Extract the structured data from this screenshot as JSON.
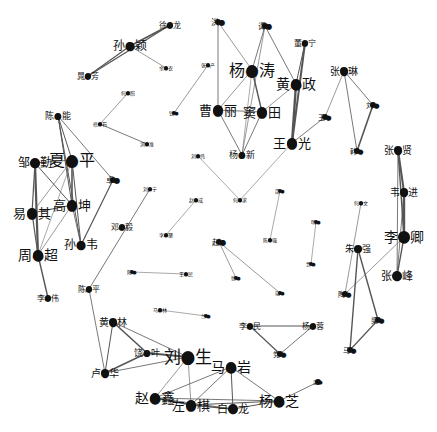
{
  "graph": {
    "title": "",
    "background": "#ffffff",
    "node_color": "#111111",
    "edge_color": "#555555",
    "nodes": [
      {
        "id": "sunyingying",
        "label": "孙●颖",
        "x": 130,
        "y": 46,
        "r": 4,
        "size": 12
      },
      {
        "id": "xulong",
        "label": "徐●龙",
        "x": 170,
        "y": 25,
        "r": 3,
        "size": 8
      },
      {
        "id": "jingfang",
        "label": "晁●芳",
        "x": 88,
        "y": 76,
        "r": 3,
        "size": 8
      },
      {
        "id": "yuanwei",
        "label": "余●衣",
        "x": 166,
        "y": 68,
        "r": 2,
        "size": 5
      },
      {
        "id": "hezhao",
        "label": "何●照",
        "x": 128,
        "y": 93,
        "r": 2,
        "size": 5
      },
      {
        "id": "zhangtai",
        "label": "修●石",
        "x": 100,
        "y": 124,
        "r": 2,
        "size": 5
      },
      {
        "id": "shengsheng",
        "label": "浏●准",
        "x": 147,
        "y": 144,
        "r": 2,
        "size": 5
      },
      {
        "id": "zhangchan",
        "label": "张●产",
        "x": 208,
        "y": 65,
        "r": 2,
        "size": 5
      },
      {
        "id": "jinmin",
        "label": "钱●",
        "x": 174,
        "y": 113,
        "r": 2,
        "size": 5
      },
      {
        "id": "hongbei",
        "label": "洪●",
        "x": 218,
        "y": 22,
        "r": 3,
        "size": 8
      },
      {
        "id": "tongyuan",
        "label": "谭●",
        "x": 265,
        "y": 26,
        "r": 3,
        "size": 8
      },
      {
        "id": "yangjiatao",
        "label": "杨●涛",
        "x": 252,
        "y": 70,
        "r": 5,
        "size": 16
      },
      {
        "id": "dongning",
        "label": "董●宁",
        "x": 305,
        "y": 43,
        "r": 3,
        "size": 8
      },
      {
        "id": "huangzheng",
        "label": "黄●政",
        "x": 296,
        "y": 84,
        "r": 5,
        "size": 14
      },
      {
        "id": "caoli",
        "label": "曹●丽",
        "x": 218,
        "y": 110,
        "r": 5,
        "size": 13
      },
      {
        "id": "dutian",
        "label": "窦●田",
        "x": 262,
        "y": 112,
        "r": 5,
        "size": 13
      },
      {
        "id": "yangxin",
        "label": "杨●新",
        "x": 242,
        "y": 155,
        "r": 3,
        "size": 9
      },
      {
        "id": "wangguang",
        "label": "王●光",
        "x": 292,
        "y": 143,
        "r": 5,
        "size": 13
      },
      {
        "id": "zhanglin",
        "label": "张●琳",
        "x": 344,
        "y": 71,
        "r": 4,
        "size": 10
      },
      {
        "id": "liuhao",
        "label": "刘●",
        "x": 373,
        "y": 105,
        "r": 3,
        "size": 7
      },
      {
        "id": "wangyu",
        "label": "王●",
        "x": 325,
        "y": 117,
        "r": 3,
        "size": 7
      },
      {
        "id": "hanhua",
        "label": "韩●",
        "x": 357,
        "y": 151,
        "r": 3,
        "size": 7
      },
      {
        "id": "zhangxian",
        "label": "张●贤",
        "x": 398,
        "y": 150,
        "r": 4,
        "size": 10
      },
      {
        "id": "weijin",
        "label": "韦●进",
        "x": 404,
        "y": 192,
        "r": 4,
        "size": 10
      },
      {
        "id": "liqing",
        "label": "李●卿",
        "x": 404,
        "y": 237,
        "r": 6,
        "size": 14
      },
      {
        "id": "zhangfeng",
        "label": "张●峰",
        "x": 397,
        "y": 276,
        "r": 5,
        "size": 11
      },
      {
        "id": "hewen",
        "label": "何●文",
        "x": 361,
        "y": 203,
        "r": 2,
        "size": 5
      },
      {
        "id": "zhuqiang",
        "label": "朱●强",
        "x": 358,
        "y": 249,
        "r": 4,
        "size": 9
      },
      {
        "id": "tengjie",
        "label": "陶●",
        "x": 345,
        "y": 294,
        "r": 3,
        "size": 7
      },
      {
        "id": "liangjie",
        "label": "梁●",
        "x": 378,
        "y": 320,
        "r": 3,
        "size": 7
      },
      {
        "id": "mahong",
        "label": "马●",
        "x": 350,
        "y": 350,
        "r": 3,
        "size": 7
      },
      {
        "id": "chenneng",
        "label": "陈●能",
        "x": 58,
        "y": 116,
        "r": 3,
        "size": 9
      },
      {
        "id": "zoumin",
        "label": "邹●勤",
        "x": 35,
        "y": 163,
        "r": 5,
        "size": 12
      },
      {
        "id": "xiaping",
        "label": "夏●平",
        "x": 72,
        "y": 160,
        "r": 5,
        "size": 16
      },
      {
        "id": "yiqi",
        "label": "易●其",
        "x": 32,
        "y": 213,
        "r": 5,
        "size": 13
      },
      {
        "id": "gaoshen",
        "label": "高●坤",
        "x": 72,
        "y": 205,
        "r": 5,
        "size": 13
      },
      {
        "id": "sunwei",
        "label": "孙●韦",
        "x": 81,
        "y": 245,
        "r": 4,
        "size": 12
      },
      {
        "id": "zhouchao",
        "label": "周●超",
        "x": 38,
        "y": 255,
        "r": 5,
        "size": 14
      },
      {
        "id": "liwei",
        "label": "李●伟",
        "x": 48,
        "y": 298,
        "r": 3,
        "size": 8
      },
      {
        "id": "yingjun",
        "label": "卓●",
        "x": 113,
        "y": 180,
        "r": 3,
        "size": 8
      },
      {
        "id": "dengyi",
        "label": "邓●毅",
        "x": 122,
        "y": 227,
        "r": 3,
        "size": 8
      },
      {
        "id": "liuning",
        "label": "刘●宁",
        "x": 150,
        "y": 189,
        "r": 2,
        "size": 5
      },
      {
        "id": "chenping",
        "label": "陈●平",
        "x": 89,
        "y": 289,
        "r": 3,
        "size": 8
      },
      {
        "id": "shengfeng",
        "label": "刘●伟",
        "x": 198,
        "y": 156,
        "r": 2,
        "size": 5
      },
      {
        "id": "zhaocheng",
        "label": "赵●成",
        "x": 196,
        "y": 200,
        "r": 2,
        "size": 5
      },
      {
        "id": "liju",
        "label": "李●聚",
        "x": 166,
        "y": 235,
        "r": 2,
        "size": 5
      },
      {
        "id": "heyan",
        "label": "何●求",
        "x": 240,
        "y": 200,
        "r": 2,
        "size": 5
      },
      {
        "id": "shaoping",
        "label": "邵●",
        "x": 280,
        "y": 191,
        "r": 2,
        "size": 5
      },
      {
        "id": "chenmei",
        "label": "陈●强",
        "x": 270,
        "y": 240,
        "r": 2,
        "size": 5
      },
      {
        "id": "zhaozhuang",
        "label": "赵●",
        "x": 219,
        "y": 242,
        "r": 3,
        "size": 8
      },
      {
        "id": "xuzhi",
        "label": "徐●",
        "x": 236,
        "y": 278,
        "r": 2,
        "size": 5
      },
      {
        "id": "ruiyan",
        "label": "瑞●",
        "x": 280,
        "y": 293,
        "r": 2,
        "size": 5
      },
      {
        "id": "mingxuan",
        "label": "明●",
        "x": 316,
        "y": 222,
        "r": 2,
        "size": 5
      },
      {
        "id": "jiaqin",
        "label": "贾●",
        "x": 311,
        "y": 264,
        "r": 2,
        "size": 5
      },
      {
        "id": "zhaolin",
        "label": "陈●",
        "x": 132,
        "y": 272,
        "r": 2,
        "size": 5
      },
      {
        "id": "wangli",
        "label": "王●民",
        "x": 186,
        "y": 274,
        "r": 2,
        "size": 5
      },
      {
        "id": "mazhen",
        "label": "马●林",
        "x": 160,
        "y": 310,
        "r": 2,
        "size": 5
      },
      {
        "id": "lanlan",
        "label": "兰●",
        "x": 206,
        "y": 316,
        "r": 2,
        "size": 5
      },
      {
        "id": "limin",
        "label": "李●民",
        "x": 250,
        "y": 326,
        "r": 3,
        "size": 8
      },
      {
        "id": "yangrong",
        "label": "杨●蓉",
        "x": 313,
        "y": 326,
        "r": 3,
        "size": 8
      },
      {
        "id": "xuepeng",
        "label": "党●",
        "x": 280,
        "y": 354,
        "r": 3,
        "size": 7
      },
      {
        "id": "huanglin",
        "label": "黄●林",
        "x": 113,
        "y": 322,
        "r": 4,
        "size": 10
      },
      {
        "id": "jiaye",
        "label": "饶●叶",
        "x": 147,
        "y": 353,
        "r": 3,
        "size": 9
      },
      {
        "id": "luhua",
        "label": "卢●华",
        "x": 105,
        "y": 373,
        "r": 4,
        "size": 10
      },
      {
        "id": "liuxusheng",
        "label": "刘●生",
        "x": 188,
        "y": 357,
        "r": 6,
        "size": 17
      },
      {
        "id": "mayan",
        "label": "马●岩",
        "x": 231,
        "y": 367,
        "r": 5,
        "size": 14
      },
      {
        "id": "zhaoxin",
        "label": "赵●鑫",
        "x": 155,
        "y": 398,
        "r": 5,
        "size": 14
      },
      {
        "id": "zuobing",
        "label": "左●棋",
        "x": 191,
        "y": 405,
        "r": 5,
        "size": 13
      },
      {
        "id": "bailong",
        "label": "白●龙",
        "x": 233,
        "y": 409,
        "r": 5,
        "size": 11
      },
      {
        "id": "yangzhi",
        "label": "杨●芝",
        "x": 279,
        "y": 401,
        "r": 5,
        "size": 14
      },
      {
        "id": "youxuan",
        "label": "游●",
        "x": 318,
        "y": 382,
        "r": 3,
        "size": 5
      }
    ],
    "edges": [
      {
        "s": "sunyingying",
        "t": "xulong",
        "w": 1.6
      },
      {
        "s": "xulong",
        "t": "jingfang",
        "w": 1.2
      },
      {
        "s": "sunyingying",
        "t": "jingfang",
        "w": 1.2
      },
      {
        "s": "sunyingying",
        "t": "yuanwei",
        "w": 0.6
      },
      {
        "s": "hezhao",
        "t": "zhangtai",
        "w": 0.6
      },
      {
        "s": "zhangtai",
        "t": "shengsheng",
        "w": 0.8
      },
      {
        "s": "zhangchan",
        "t": "jinmin",
        "w": 0.6
      },
      {
        "s": "hongbei",
        "t": "caoli",
        "w": 0.8
      },
      {
        "s": "hongbei",
        "t": "yangjiatao",
        "w": 0.6
      },
      {
        "s": "tongyuan",
        "t": "yangjiatao",
        "w": 0.8
      },
      {
        "s": "tongyuan",
        "t": "huangzheng",
        "w": 0.8
      },
      {
        "s": "tongyuan",
        "t": "yangxin",
        "w": 0.6
      },
      {
        "s": "yangjiatao",
        "t": "caoli",
        "w": 0.6
      },
      {
        "s": "yangjiatao",
        "t": "dutian",
        "w": 1.4
      },
      {
        "s": "yangjiatao",
        "t": "yangxin",
        "w": 0.5
      },
      {
        "s": "caoli",
        "t": "dutian",
        "w": 0.8
      },
      {
        "s": "caoli",
        "t": "yangxin",
        "w": 0.8
      },
      {
        "s": "dutian",
        "t": "yangxin",
        "w": 0.8
      },
      {
        "s": "dutian",
        "t": "huangzheng",
        "w": 0.6
      },
      {
        "s": "huangzheng",
        "t": "wangguang",
        "w": 2.4
      },
      {
        "s": "dongning",
        "t": "wangguang",
        "w": 2.0
      },
      {
        "s": "dongning",
        "t": "huangzheng",
        "w": 1.0
      },
      {
        "s": "wangguang",
        "t": "wangyu",
        "w": 0.8
      },
      {
        "s": "wangguang",
        "t": "heyan",
        "w": 0.5
      },
      {
        "s": "zhanglin",
        "t": "liuhao",
        "w": 0.8
      },
      {
        "s": "zhanglin",
        "t": "wangyu",
        "w": 0.6
      },
      {
        "s": "zhanglin",
        "t": "hanhua",
        "w": 0.8
      },
      {
        "s": "liuhao",
        "t": "hanhua",
        "w": 1.6
      },
      {
        "s": "zhangxian",
        "t": "weijin",
        "w": 2.0
      },
      {
        "s": "zhangxian",
        "t": "liqing",
        "w": 1.4
      },
      {
        "s": "zhangxian",
        "t": "zhangfeng",
        "w": 0.8
      },
      {
        "s": "weijin",
        "t": "liqing",
        "w": 2.4
      },
      {
        "s": "weijin",
        "t": "zhangfeng",
        "w": 0.8
      },
      {
        "s": "liqing",
        "t": "zhangfeng",
        "w": 1.4
      },
      {
        "s": "liqing",
        "t": "tengjie",
        "w": 0.6
      },
      {
        "s": "hewen",
        "t": "tengjie",
        "w": 0.6
      },
      {
        "s": "zhuqiang",
        "t": "mahong",
        "w": 1.4
      },
      {
        "s": "zhuqiang",
        "t": "liangjie",
        "w": 1.4
      },
      {
        "s": "liangjie",
        "t": "mahong",
        "w": 1.2
      },
      {
        "s": "chenneng",
        "t": "xiaping",
        "w": 1.0
      },
      {
        "s": "chenneng",
        "t": "gaoshen",
        "w": 1.0
      },
      {
        "s": "chenneng",
        "t": "sunwei",
        "w": 1.0
      },
      {
        "s": "chenneng",
        "t": "yingjun",
        "w": 0.8
      },
      {
        "s": "zoumin",
        "t": "xiaping",
        "w": 0.8
      },
      {
        "s": "zoumin",
        "t": "gaoshen",
        "w": 1.0
      },
      {
        "s": "zoumin",
        "t": "zhouchao",
        "w": 2.2
      },
      {
        "s": "zoumin",
        "t": "yiqi",
        "w": 1.2
      },
      {
        "s": "xiaping",
        "t": "gaoshen",
        "w": 1.6
      },
      {
        "s": "xiaping",
        "t": "yiqi",
        "w": 0.6
      },
      {
        "s": "xiaping",
        "t": "zhouchao",
        "w": 0.5
      },
      {
        "s": "xiaping",
        "t": "sunwei",
        "w": 1.0
      },
      {
        "s": "yiqi",
        "t": "gaoshen",
        "w": 1.2
      },
      {
        "s": "yiqi",
        "t": "zhouchao",
        "w": 1.2
      },
      {
        "s": "gaoshen",
        "t": "zhouchao",
        "w": 0.6
      },
      {
        "s": "gaoshen",
        "t": "sunwei",
        "w": 0.8
      },
      {
        "s": "zhouchao",
        "t": "liwei",
        "w": 1.4
      },
      {
        "s": "yingjun",
        "t": "sunwei",
        "w": 1.2
      },
      {
        "s": "liuning",
        "t": "chenping",
        "w": 0.8
      },
      {
        "s": "chenping",
        "t": "luhua",
        "w": 0.8
      },
      {
        "s": "shengfeng",
        "t": "heyan",
        "w": 0.5
      },
      {
        "s": "zhaocheng",
        "t": "liju",
        "w": 0.5
      },
      {
        "s": "shaoping",
        "t": "chenmei",
        "w": 0.5
      },
      {
        "s": "zhaozhuang",
        "t": "xuzhi",
        "w": 0.6
      },
      {
        "s": "zhaozhuang",
        "t": "ruiyan",
        "w": 0.6
      },
      {
        "s": "mingxuan",
        "t": "jiaqin",
        "w": 0.5
      },
      {
        "s": "zhaolin",
        "t": "wangli",
        "w": 0.5
      },
      {
        "s": "mazhen",
        "t": "lanlan",
        "w": 0.5
      },
      {
        "s": "limin",
        "t": "yangrong",
        "w": 1.0
      },
      {
        "s": "limin",
        "t": "xuepeng",
        "w": 1.2
      },
      {
        "s": "yangrong",
        "t": "xuepeng",
        "w": 0.8
      },
      {
        "s": "huanglin",
        "t": "jiaye",
        "w": 1.6
      },
      {
        "s": "huanglin",
        "t": "luhua",
        "w": 1.0
      },
      {
        "s": "huanglin",
        "t": "liuxusheng",
        "w": 0.8
      },
      {
        "s": "jiaye",
        "t": "liuxusheng",
        "w": 2.0
      },
      {
        "s": "jiaye",
        "t": "luhua",
        "w": 1.4
      },
      {
        "s": "luhua",
        "t": "liuxusheng",
        "w": 0.8
      },
      {
        "s": "liuxusheng",
        "t": "zhaoxin",
        "w": 0.6
      },
      {
        "s": "liuxusheng",
        "t": "zuobing",
        "w": 0.6
      },
      {
        "s": "mayan",
        "t": "zhaoxin",
        "w": 0.8
      },
      {
        "s": "mayan",
        "t": "zuobing",
        "w": 0.8
      },
      {
        "s": "mayan",
        "t": "bailong",
        "w": 1.0
      },
      {
        "s": "mayan",
        "t": "yangzhi",
        "w": 0.8
      },
      {
        "s": "zhaoxin",
        "t": "zuobing",
        "w": 1.4
      },
      {
        "s": "zhaoxin",
        "t": "bailong",
        "w": 0.8
      },
      {
        "s": "zhaoxin",
        "t": "yangzhi",
        "w": 0.8
      },
      {
        "s": "zuobing",
        "t": "bailong",
        "w": 1.4
      },
      {
        "s": "zuobing",
        "t": "yangzhi",
        "w": 1.0
      },
      {
        "s": "bailong",
        "t": "yangzhi",
        "w": 1.0
      },
      {
        "s": "yangzhi",
        "t": "youxuan",
        "w": 0.8
      }
    ]
  }
}
